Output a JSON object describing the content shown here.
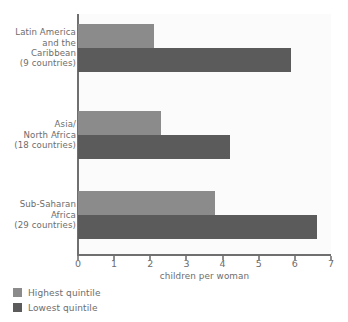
{
  "title_remnant": "",
  "chart_data": {
    "type": "bar",
    "orientation": "horizontal",
    "title": "",
    "xlabel": "children per woman",
    "ylabel": "",
    "xlim": [
      0,
      7
    ],
    "xticks": [
      "0",
      "1",
      "2",
      "3",
      "4",
      "5",
      "6",
      "7"
    ],
    "grid": false,
    "legend_position": "bottom-left",
    "categories": [
      "Latin America\nand the\nCaribbean\n(9 countries)",
      "Asia/\nNorth Africa\n(18 countries)",
      "Sub-Saharan\nAfrica\n(29 countries)"
    ],
    "category_lines": [
      [
        "Latin America",
        "and the",
        "Caribbean",
        "(9 countries)"
      ],
      [
        "Asia/",
        "North Africa",
        "(18 countries)"
      ],
      [
        "Sub-Saharan",
        "Africa",
        "(29 countries)"
      ]
    ],
    "series": [
      {
        "name": "Highest quintile",
        "color": "#8b8b8b",
        "values": [
          2.1,
          2.3,
          3.8
        ]
      },
      {
        "name": "Lowest quintile",
        "color": "#5b5b5b",
        "values": [
          5.9,
          4.2,
          6.6
        ]
      }
    ]
  },
  "legend": {
    "items": [
      {
        "label": "Highest quintile",
        "color": "#8b8b8b"
      },
      {
        "label": "Lowest quintile",
        "color": "#5b5b5b"
      }
    ]
  },
  "axis": {
    "x_title": "children per woman"
  },
  "colors": {
    "highest": "#8b8b8b",
    "lowest": "#5b5b5b",
    "axis": "#6f6f6f",
    "text": "#6d6d6d",
    "plot_background": "#fbfbfb"
  }
}
